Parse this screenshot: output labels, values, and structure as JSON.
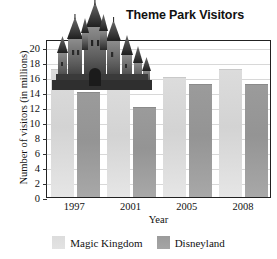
{
  "chart_data": {
    "type": "bar",
    "title": "Theme Park Visitors",
    "xlabel": "Year",
    "ylabel": "Number of visitors (in millions)",
    "categories": [
      "1997",
      "2001",
      "2005",
      "2008"
    ],
    "series": [
      {
        "name": "Magic Kingdom",
        "color": "#d8d8d8",
        "values": [
          17,
          15,
          16,
          17
        ]
      },
      {
        "name": "Disneyland",
        "color": "#9b9b9b",
        "values": [
          14,
          12,
          15,
          15
        ]
      }
    ],
    "ylim": [
      0,
      21
    ],
    "yticks": [
      0,
      2,
      4,
      6,
      8,
      10,
      12,
      14,
      16,
      18,
      20
    ],
    "ytick_labels": [
      "0",
      "2",
      "4",
      "6",
      "8",
      "10",
      "12",
      "14",
      "16",
      "18",
      "20"
    ],
    "grid": true,
    "legend_position": "bottom",
    "annotations": [
      "castle-image"
    ]
  },
  "legend": {
    "entries": [
      {
        "label": "Magic Kingdom",
        "swatch": "mk"
      },
      {
        "label": "Disneyland",
        "swatch": "dl"
      }
    ]
  },
  "icons": {
    "castle": "castle-illustration"
  }
}
